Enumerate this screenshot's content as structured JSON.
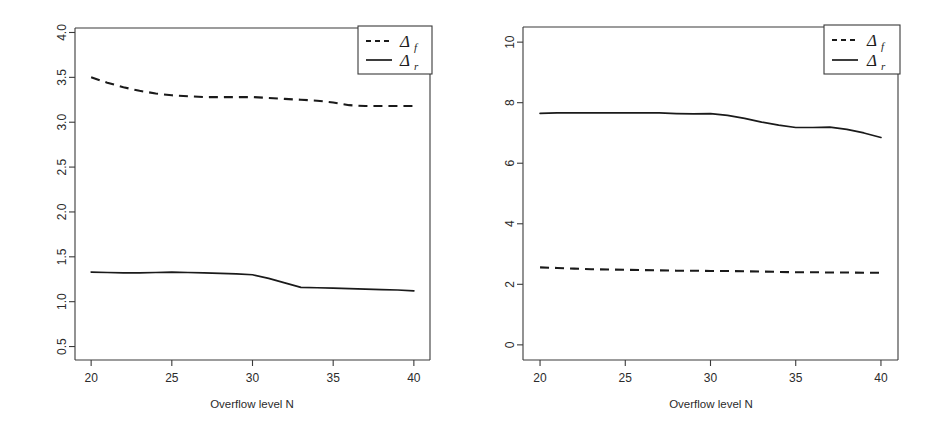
{
  "figure": {
    "background": "#ffffff",
    "foreground": "#1a1a1a",
    "panel_count": 2
  },
  "chart_data": [
    {
      "panel": "left",
      "type": "line",
      "title": "",
      "xlabel": "Overflow level N",
      "ylabel": "",
      "xlim": [
        19,
        41
      ],
      "ylim": [
        0.35,
        4.05
      ],
      "grid": false,
      "legend_position": "top-right",
      "xticks": [
        20,
        25,
        30,
        35,
        40
      ],
      "xtick_labels": [
        "20",
        "25",
        "30",
        "35",
        "40"
      ],
      "yticks": [
        0.5,
        1.0,
        1.5,
        2.0,
        2.5,
        3.0,
        3.5,
        4.0
      ],
      "ytick_labels": [
        "0.5",
        "1.0",
        "1.5",
        "2.0",
        "2.5",
        "3.0",
        "3.5",
        "4.0"
      ],
      "x": [
        20,
        21,
        22,
        23,
        24,
        25,
        26,
        27,
        28,
        29,
        30,
        31,
        32,
        33,
        34,
        35,
        36,
        37,
        38,
        39,
        40
      ],
      "series": [
        {
          "name": "delta_f",
          "label": "Δ",
          "subscript": "f",
          "style": "dashed",
          "color": "#1a1a1a",
          "values": [
            3.5,
            3.44,
            3.39,
            3.35,
            3.32,
            3.3,
            3.29,
            3.28,
            3.28,
            3.28,
            3.28,
            3.27,
            3.26,
            3.25,
            3.24,
            3.22,
            3.19,
            3.18,
            3.18,
            3.18,
            3.18
          ]
        },
        {
          "name": "delta_r",
          "label": "Δ",
          "subscript": "r",
          "style": "solid",
          "color": "#1a1a1a",
          "values": [
            1.33,
            1.325,
            1.32,
            1.32,
            1.325,
            1.33,
            1.325,
            1.32,
            1.315,
            1.31,
            1.3,
            1.26,
            1.21,
            1.16,
            1.155,
            1.15,
            1.145,
            1.14,
            1.135,
            1.13,
            1.12
          ]
        }
      ]
    },
    {
      "panel": "right",
      "type": "line",
      "title": "",
      "xlabel": "Overflow level N",
      "ylabel": "",
      "xlim": [
        19,
        41
      ],
      "ylim": [
        -0.5,
        10.5
      ],
      "grid": false,
      "legend_position": "top-right",
      "xticks": [
        20,
        25,
        30,
        35,
        40
      ],
      "xtick_labels": [
        "20",
        "25",
        "30",
        "35",
        "40"
      ],
      "yticks": [
        0,
        2,
        4,
        6,
        8,
        10
      ],
      "ytick_labels": [
        "0",
        "2",
        "4",
        "6",
        "8",
        "10"
      ],
      "x": [
        20,
        21,
        22,
        23,
        24,
        25,
        26,
        27,
        28,
        29,
        30,
        31,
        32,
        33,
        34,
        35,
        36,
        37,
        38,
        39,
        40
      ],
      "series": [
        {
          "name": "delta_f",
          "label": "Δ",
          "subscript": "f",
          "style": "dashed",
          "color": "#1a1a1a",
          "values": [
            2.56,
            2.54,
            2.52,
            2.5,
            2.49,
            2.48,
            2.47,
            2.46,
            2.45,
            2.45,
            2.44,
            2.44,
            2.43,
            2.42,
            2.41,
            2.4,
            2.4,
            2.39,
            2.39,
            2.38,
            2.38
          ]
        },
        {
          "name": "delta_r",
          "label": "Δ",
          "subscript": "r",
          "style": "solid",
          "color": "#1a1a1a",
          "values": [
            7.65,
            7.66,
            7.66,
            7.66,
            7.66,
            7.66,
            7.66,
            7.66,
            7.64,
            7.63,
            7.64,
            7.58,
            7.48,
            7.36,
            7.26,
            7.18,
            7.18,
            7.19,
            7.12,
            7.0,
            6.85
          ]
        }
      ]
    }
  ],
  "legend": {
    "entries": [
      {
        "key": "dashed",
        "symbol": "Δ",
        "subscript": "f"
      },
      {
        "key": "solid",
        "symbol": "Δ",
        "subscript": "r"
      }
    ]
  },
  "labels": {
    "xaxis_title": "Overflow level N"
  }
}
